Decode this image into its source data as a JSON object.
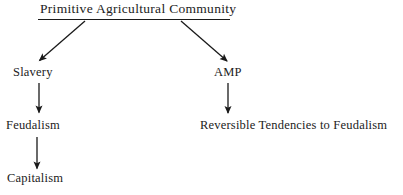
{
  "diagram": {
    "title_node": {
      "label": "Primitive Agricultural Community",
      "underlined": true
    },
    "nodes": [
      {
        "id": "primitive",
        "label": "Primitive Agricultural Community"
      },
      {
        "id": "slavery",
        "label": "Slavery"
      },
      {
        "id": "feudalism",
        "label": "Feudalism"
      },
      {
        "id": "capitalism",
        "label": "Capitalism"
      },
      {
        "id": "amp",
        "label": "AMP"
      },
      {
        "id": "reversible",
        "label": "Reversible Tendencies to Feudalism"
      }
    ],
    "edges": [
      {
        "from": "primitive",
        "to": "slavery",
        "style": "diagonal-arrow"
      },
      {
        "from": "primitive",
        "to": "amp",
        "style": "diagonal-arrow"
      },
      {
        "from": "slavery",
        "to": "feudalism",
        "style": "vertical-arrow"
      },
      {
        "from": "feudalism",
        "to": "capitalism",
        "style": "vertical-arrow"
      },
      {
        "from": "amp",
        "to": "reversible",
        "style": "vertical-arrow"
      }
    ],
    "colors": {
      "background": "#ffffff",
      "ink": "#1a1a1a",
      "text": "#222222"
    }
  }
}
